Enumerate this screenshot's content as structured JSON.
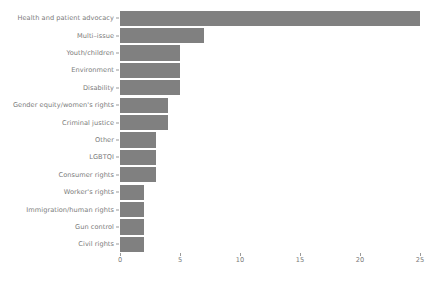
{
  "chart_data": {
    "type": "bar",
    "orientation": "horizontal",
    "title": "",
    "subtitle": "",
    "xlabel": "",
    "ylabel": "",
    "xlim": [
      0,
      25
    ],
    "xticks": [
      0,
      5,
      10,
      15,
      20,
      25
    ],
    "xtick_labels": [
      "0",
      "5",
      "10",
      "15",
      "20",
      "25"
    ],
    "grid": false,
    "legend": null,
    "bar_color": "#808080",
    "text_color": "#7b7b7b",
    "background_color": "#ffffff",
    "categories": [
      "Health and patient advocacy",
      "Multi–issue",
      "Youth/children",
      "Environment",
      "Disability",
      "Gender equity/women's rights",
      "Criminal justice",
      "Other",
      "LGBTQI",
      "Consumer rights",
      "Worker's rights",
      "Immigration/human rights",
      "Gun control",
      "Civil rights"
    ],
    "values": [
      25,
      7,
      5,
      5,
      5,
      4,
      4,
      3,
      3,
      3,
      2,
      2,
      2,
      2
    ]
  }
}
